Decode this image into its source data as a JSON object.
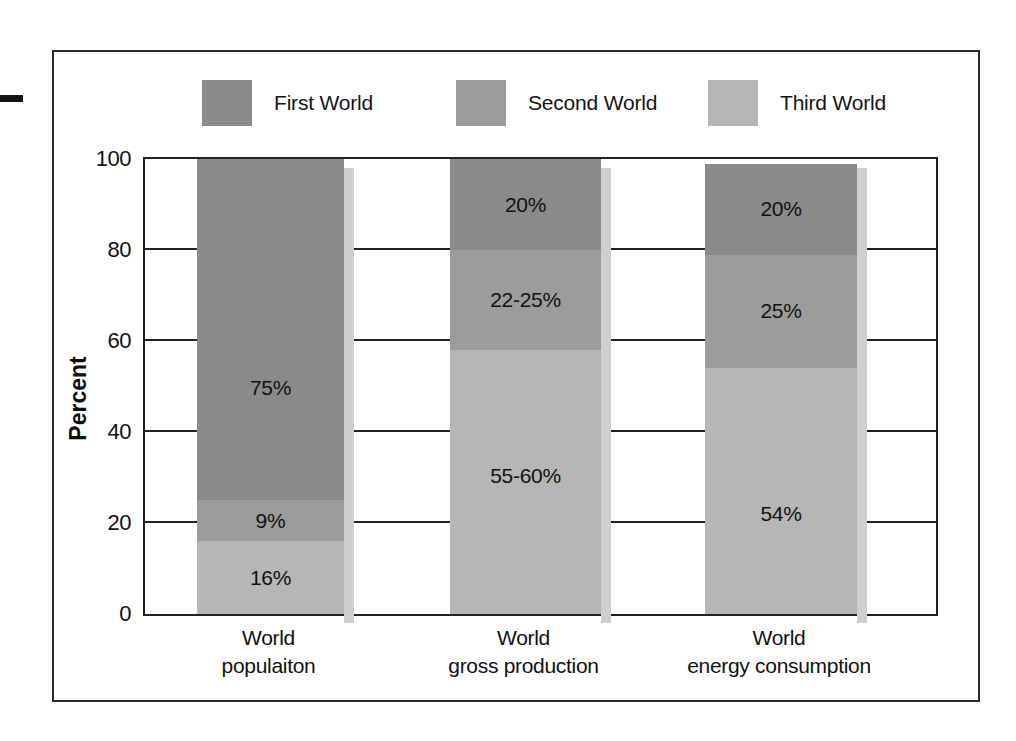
{
  "figure": {
    "edge_mark": "page-edge-dash"
  },
  "legend": {
    "position": "top",
    "items": [
      {
        "label": "First World",
        "color": "#8a8a8a"
      },
      {
        "label": "Second World",
        "color": "#9c9c9c"
      },
      {
        "label": "Third World",
        "color": "#b6b6b6"
      }
    ]
  },
  "axes": {
    "y_title": "Percent",
    "y_ticks": [
      "0",
      "20",
      "40",
      "60",
      "80",
      "100"
    ],
    "y_min": 0,
    "y_max": 100
  },
  "chart_data": {
    "type": "bar",
    "subtype": "stacked-bar",
    "title": "",
    "xlabel": "",
    "ylabel": "Percent",
    "ylim": [
      0,
      100
    ],
    "grid": true,
    "legend_position": "top",
    "categories": [
      "World populaiton",
      "World gross production",
      "World energy consumption"
    ],
    "category_lines": [
      [
        "World",
        "populaiton"
      ],
      [
        "World",
        "gross production"
      ],
      [
        "World",
        "energy consumption"
      ]
    ],
    "series": [
      {
        "name": "Third World",
        "color": "#b6b6b6",
        "values": [
          16,
          58,
          54
        ],
        "labels": [
          "16%",
          "55-60%",
          "54%"
        ]
      },
      {
        "name": "Second World",
        "color": "#9c9c9c",
        "values": [
          9,
          22,
          25
        ],
        "labels": [
          "9%",
          "22-25%",
          "25%"
        ]
      },
      {
        "name": "First World",
        "color": "#8a8a8a",
        "values": [
          75,
          20,
          20
        ],
        "labels": [
          "75%",
          "20%",
          "20%"
        ]
      }
    ],
    "stack_order_bottom_to_top": [
      "Third World",
      "Second World",
      "First World"
    ]
  },
  "colors": {
    "frame": "#2b2b2b",
    "axis": "#222222",
    "background": "#ffffff",
    "shadow": "#cfcfcf",
    "text": "#111111"
  }
}
